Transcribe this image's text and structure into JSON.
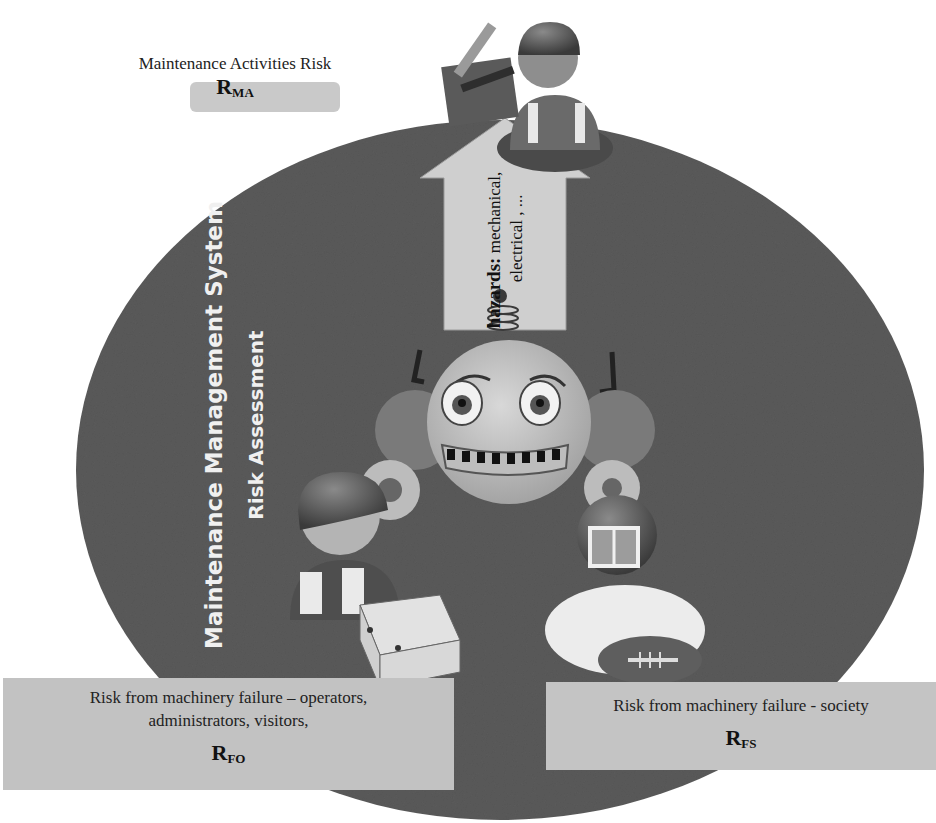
{
  "diagram": {
    "title_vertical": "Maintenance Management System",
    "subtitle_vertical": "Risk Assessment",
    "colors": {
      "circle": "#5a5a5a",
      "panel": "#c2c2c2",
      "arrow": "#cfcfcf",
      "text_light": "#f0f0f0",
      "text_dark": "#222222"
    },
    "maintenance_activities": {
      "label": "Maintenance Activities Risk",
      "symbol": "R",
      "subscript": "MA"
    },
    "hazards": {
      "heading": "hazards:",
      "line1": "mechanical,",
      "line2": "electrical , ..."
    },
    "failure_operators": {
      "line1": "Risk from machinery failure – operators,",
      "line2": "administrators, visitors,",
      "symbol": "R",
      "subscript": "FO"
    },
    "failure_society": {
      "line1": "Risk from machinery failure - society",
      "symbol": "R",
      "subscript": "FS"
    },
    "figures": [
      {
        "name": "maintenance-worker-with-toolbox"
      },
      {
        "name": "robot-face"
      },
      {
        "name": "operator-with-boxes"
      },
      {
        "name": "football-player"
      }
    ]
  }
}
